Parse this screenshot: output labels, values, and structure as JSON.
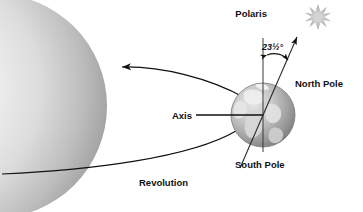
{
  "figure": {
    "width": 363,
    "height": 212,
    "background_color": "#ffffff"
  },
  "labels": {
    "polaris": "Polaris",
    "tilt_angle": "23½°",
    "north_pole": "North Pole",
    "axis": "Axis",
    "south_pole": "South Pole",
    "revolution": "Revolution"
  },
  "icons": {
    "star": "star-burst-icon",
    "sun": "sun-sphere-icon",
    "earth": "earth-globe-icon",
    "arrow_orbit_upper": "arrow-left-icon",
    "arrow_axis": "arrow-up-right-icon",
    "arrow_angle": "double-arrow-arc-icon"
  },
  "values": {
    "tilt_degrees": 23.5,
    "tilt_degrees_text": "23½°"
  },
  "colors": {
    "ink": "#111111",
    "sun_light": "#f2f2f2",
    "sun_mid": "#c8c8c8",
    "sun_dark": "#8e8e8e",
    "earth_ocean_light": "#d8d8d8",
    "earth_ocean_dark": "#6f6f6f",
    "earth_land": "#ededed",
    "star_grey": "#b9b9b9",
    "axis_line": "#2b2b2b"
  }
}
